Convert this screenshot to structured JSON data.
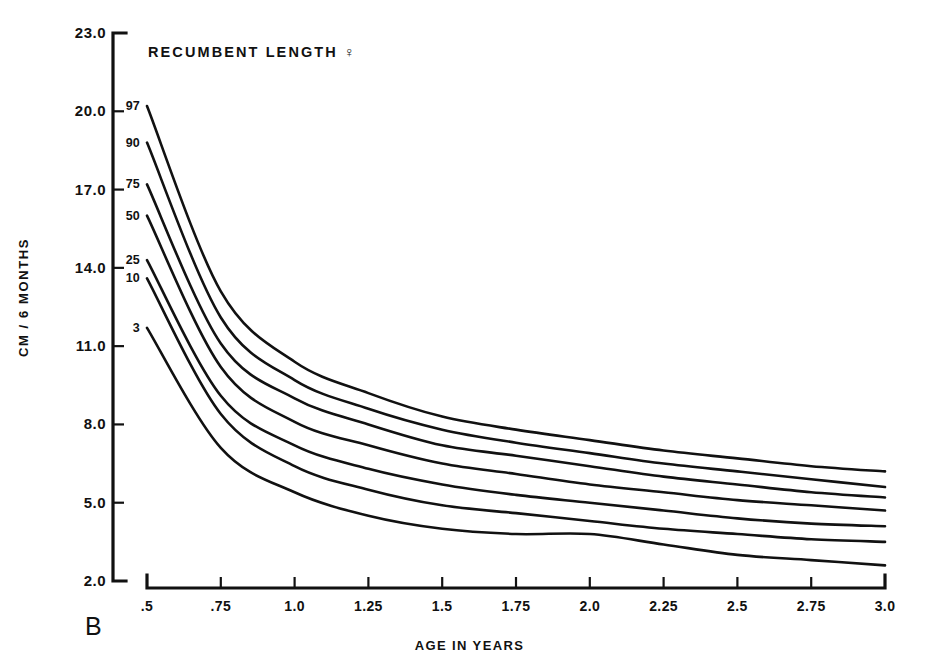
{
  "figure": {
    "panel_label": "B",
    "title": "RECUMBENT LENGTH ♀"
  },
  "axes": {
    "y_title": "CM / 6 MONTHS",
    "x_title": "AGE IN YEARS",
    "y_ticks": [
      "2.0",
      "5.0",
      "8.0",
      "11.0",
      "14.0",
      "17.0",
      "20.0",
      "23.0"
    ],
    "x_ticks": [
      ".5",
      ".75",
      "1.0",
      "1.25",
      "1.5",
      "1.75",
      "2.0",
      "2.25",
      "2.5",
      "2.75",
      "3.0"
    ]
  },
  "percentile_labels": [
    "97",
    "90",
    "75",
    "50",
    "25",
    "10",
    "3"
  ],
  "chart_data": {
    "type": "line",
    "title": "RECUMBENT LENGTH ♀",
    "subtitle": "B",
    "xlabel": "AGE IN YEARS",
    "ylabel": "CM / 6 MONTHS",
    "xlim": [
      0.5,
      3.0
    ],
    "ylim": [
      2.0,
      23.0
    ],
    "xticks": [
      0.5,
      0.75,
      1.0,
      1.25,
      1.5,
      1.75,
      2.0,
      2.25,
      2.5,
      2.75,
      3.0
    ],
    "yticks": [
      2.0,
      5.0,
      8.0,
      11.0,
      14.0,
      17.0,
      20.0,
      23.0
    ],
    "grid": false,
    "legend": "inline-left-labels",
    "x": [
      0.5,
      0.75,
      1.0,
      1.25,
      1.5,
      1.75,
      2.0,
      2.25,
      2.5,
      2.75,
      3.0
    ],
    "series": [
      {
        "name": "97",
        "values": [
          20.2,
          13.1,
          10.4,
          9.2,
          8.3,
          7.8,
          7.4,
          7.0,
          6.7,
          6.4,
          6.2
        ]
      },
      {
        "name": "90",
        "values": [
          18.8,
          12.1,
          9.7,
          8.6,
          7.8,
          7.3,
          6.9,
          6.5,
          6.2,
          5.9,
          5.6
        ]
      },
      {
        "name": "75",
        "values": [
          17.2,
          11.1,
          9.0,
          8.0,
          7.2,
          6.8,
          6.4,
          6.0,
          5.7,
          5.4,
          5.2
        ]
      },
      {
        "name": "50",
        "values": [
          16.0,
          10.2,
          8.1,
          7.2,
          6.5,
          6.1,
          5.7,
          5.4,
          5.1,
          4.9,
          4.7
        ]
      },
      {
        "name": "25",
        "values": [
          14.3,
          9.1,
          7.2,
          6.3,
          5.7,
          5.3,
          5.0,
          4.7,
          4.4,
          4.2,
          4.1
        ]
      },
      {
        "name": "10",
        "values": [
          13.6,
          8.4,
          6.4,
          5.5,
          4.9,
          4.6,
          4.3,
          4.0,
          3.8,
          3.6,
          3.5
        ]
      },
      {
        "name": "3",
        "values": [
          11.7,
          7.1,
          5.4,
          4.5,
          4.0,
          3.8,
          3.8,
          3.4,
          3.0,
          2.8,
          2.6
        ]
      }
    ]
  }
}
